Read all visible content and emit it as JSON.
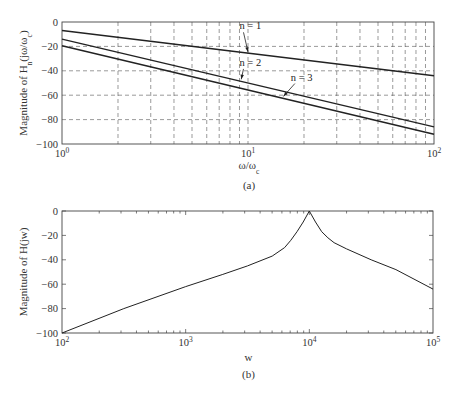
{
  "chart_data": [
    {
      "id": "a",
      "type": "line",
      "caption": "(a)",
      "xscale": "log",
      "xlim": [
        1,
        100
      ],
      "ylim": [
        -100,
        0
      ],
      "xlabel": "ω/ω_c",
      "ylabel": "Magnitude of H_n(jω/ω_c)",
      "x_ticks": [
        {
          "value": 1,
          "label": "10^0"
        },
        {
          "value": 10,
          "label": "10^1"
        },
        {
          "value": 100,
          "label": "10^2"
        }
      ],
      "y_ticks": [
        0,
        -20,
        -40,
        -60,
        -80,
        -100
      ],
      "grid": true,
      "grid_style": "dashed",
      "series": [
        {
          "name": "n = 1",
          "x": [
            1,
            100
          ],
          "values": [
            -7,
            -44
          ]
        },
        {
          "name": "n = 2",
          "x": [
            1,
            100
          ],
          "values": [
            -14,
            -86
          ]
        },
        {
          "name": "n = 3",
          "x": [
            1,
            100
          ],
          "values": [
            -19.5,
            -92
          ]
        }
      ],
      "annotations": [
        {
          "text": "n = 1",
          "text_x": 9,
          "text_y": -6,
          "arrow_to_x": 10,
          "arrow_to_y": -24.5
        },
        {
          "text": "n = 2",
          "text_x": 9,
          "text_y": -36,
          "arrow_to_x": 9.2,
          "arrow_to_y": -47
        },
        {
          "text": "n = 3",
          "text_x": 17,
          "text_y": -48,
          "arrow_to_x": 15.5,
          "arrow_to_y": -61
        }
      ]
    },
    {
      "id": "b",
      "type": "line",
      "caption": "(b)",
      "xscale": "log",
      "xlim": [
        100,
        100000
      ],
      "ylim": [
        -100,
        0
      ],
      "xlabel": "w",
      "ylabel": "Magnitude of H(jw)",
      "x_ticks": [
        {
          "value": 100,
          "label": "10^2"
        },
        {
          "value": 1000,
          "label": "10^3"
        },
        {
          "value": 10000,
          "label": "10^4"
        },
        {
          "value": 100000,
          "label": "10^5"
        }
      ],
      "y_ticks": [
        0,
        -20,
        -40,
        -60,
        -80,
        -100
      ],
      "grid": false,
      "series": [
        {
          "name": "H(jw)",
          "x": [
            100,
            316,
            1000,
            1995,
            3162,
            5012,
            6310,
            7079,
            7943,
            8913,
            10000,
            11220,
            12589,
            14125,
            15849,
            19953,
            31623,
            50119,
            100000
          ],
          "values": [
            -100,
            -80,
            -62,
            -52,
            -45,
            -37,
            -30,
            -24,
            -17,
            -9,
            0,
            -9,
            -17,
            -22,
            -26,
            -31,
            -40,
            -48,
            -64
          ]
        }
      ]
    }
  ]
}
